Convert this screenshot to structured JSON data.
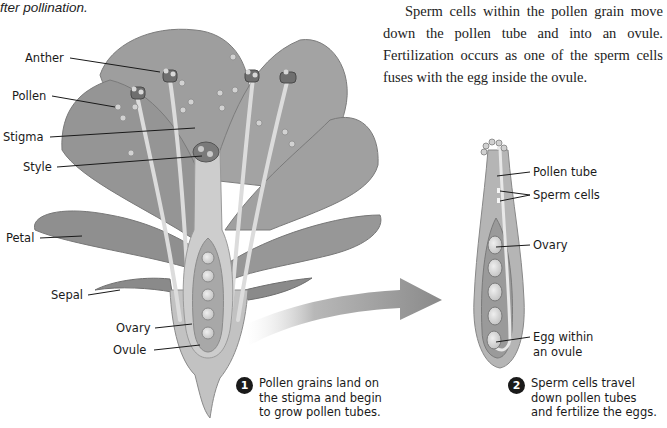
{
  "caption_fragment": "fter pollination.",
  "body_paragraph": "Sperm cells within the pollen grain move down the pollen tube and into an ovule. Fertilization occurs as one of the sperm cells fuses with the egg inside the ovule.",
  "flower_labels": {
    "anther": "Anther",
    "pollen": "Pollen",
    "stigma": "Stigma",
    "style": "Style",
    "petal": "Petal",
    "sepal": "Sepal",
    "ovary": "Ovary",
    "ovule": "Ovule"
  },
  "pistil_labels": {
    "pollen_tube": "Pollen tube",
    "sperm_cells": "Sperm cells",
    "ovary": "Ovary",
    "egg_line1": "Egg within",
    "egg_line2": "an ovule"
  },
  "steps": [
    {
      "number": "1",
      "lines": [
        "Pollen grains land on",
        "the stigma and begin",
        "to grow pollen tubes."
      ]
    },
    {
      "number": "2",
      "lines": [
        "Sperm cells travel",
        "down pollen tubes",
        "and fertilize the eggs."
      ]
    }
  ],
  "colors": {
    "petal": "#9a9a9a",
    "petal_dark": "#7e7e7e",
    "pistil": "#c4c4c4",
    "ovule": "#dcdcdc",
    "arrow": "#8c8c8c",
    "text": "#1a1a1a"
  }
}
